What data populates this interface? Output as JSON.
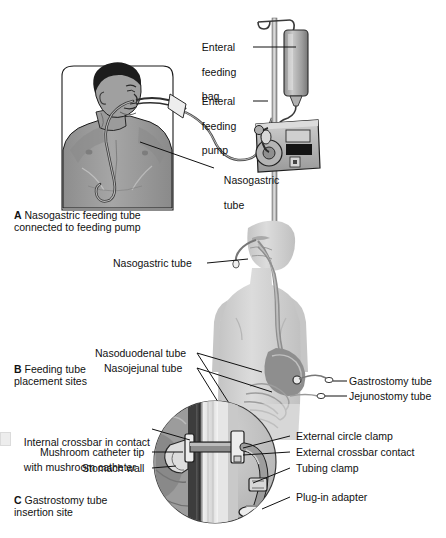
{
  "figure": {
    "background": "#ffffff",
    "colors": {
      "skin_dark": "#9a9a9a",
      "skin_mid": "#b4b4b4",
      "torso_light": "#d2d2d2",
      "hair": "#1c1c1c",
      "tube": "#8f8f8f",
      "device_body": "#b9b9b9",
      "device_dark": "#3a3a3a",
      "outline": "#1a1a1a",
      "stomach": "#8a8a8a",
      "wall_light": "#ededed",
      "inset_fill": "#cfcfcf"
    }
  },
  "panelA": {
    "caption_letter": "A",
    "caption_text": "Nasogastric feeding tube",
    "caption_text2": "connected to feeding pump",
    "labels": [
      {
        "id": "enteral-feeding-bag",
        "line1": "Enteral",
        "line2": "feeding",
        "line3": "bag"
      },
      {
        "id": "enteral-feeding-pump",
        "line1": "Enteral",
        "line2": "feeding",
        "line3": "pump"
      },
      {
        "id": "nasogastric-tube",
        "line1": "Nasogastric",
        "line2": "tube"
      }
    ]
  },
  "panelB": {
    "caption_letter": "B",
    "caption_text": "Feeding tube",
    "caption_text2": "placement sites",
    "labels": [
      {
        "id": "nasogastric-tube",
        "text": "Nasogastric tube"
      },
      {
        "id": "nasoduodenal-tube",
        "text": "Nasoduodenal tube"
      },
      {
        "id": "nasojejunal-tube",
        "text": "Nasojejunal tube"
      },
      {
        "id": "gastrostomy-tube",
        "text": "Gastrostomy tube"
      },
      {
        "id": "jejunostomy-tube",
        "text": "Jejunostomy tube"
      }
    ]
  },
  "panelC": {
    "caption_letter": "C",
    "caption_text": "Gastrostomy tube",
    "caption_text2": "insertion site",
    "labels_left": [
      {
        "id": "internal-crossbar",
        "line1": "Internal crossbar in contact",
        "line2": "with mushroom catheter"
      },
      {
        "id": "mushroom-catheter-tip",
        "text": "Mushroom catheter tip"
      },
      {
        "id": "stomach-wall",
        "text": "Stomach wall"
      }
    ],
    "labels_right": [
      {
        "id": "external-circle-clamp",
        "text": "External circle clamp"
      },
      {
        "id": "external-crossbar-contact",
        "text": "External crossbar contact"
      },
      {
        "id": "tubing-clamp",
        "text": "Tubing clamp"
      },
      {
        "id": "plug-in-adapter",
        "text": "Plug-in adapter"
      }
    ]
  }
}
